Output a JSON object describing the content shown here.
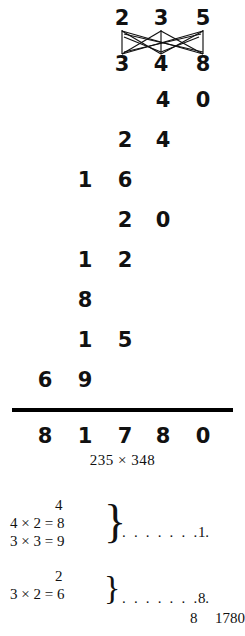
{
  "figure": {
    "caption": "235 × 348",
    "multiplicand": "235",
    "multiplier": "348",
    "product": "81780"
  },
  "lattice": {
    "top_row": [
      "2",
      "3",
      "5"
    ],
    "bottom_row": [
      "3",
      "4",
      "8"
    ],
    "top_label": "235",
    "bottom_label": "348",
    "line_color": "#111111"
  },
  "partial_rows": [
    {
      "c1": "",
      "c2": "",
      "c3": "",
      "c4": "4",
      "c5": "0"
    },
    {
      "c1": "",
      "c2": "",
      "c3": "2",
      "c4": "4",
      "c5": ""
    },
    {
      "c1": "",
      "c2": "1",
      "c3": "6",
      "c4": "",
      "c5": ""
    },
    {
      "c1": "",
      "c2": "",
      "c3": "2",
      "c4": "0",
      "c5": ""
    },
    {
      "c1": "",
      "c2": "1",
      "c3": "2",
      "c4": "",
      "c5": ""
    },
    {
      "c1": "",
      "c2": "8",
      "c3": "",
      "c4": "",
      "c5": ""
    },
    {
      "c1": "",
      "c2": "1",
      "c3": "5",
      "c4": "",
      "c5": ""
    },
    {
      "c1": "6",
      "c2": "9",
      "c3": "",
      "c4": "",
      "c5": ""
    }
  ],
  "result_row": {
    "c1": "8",
    "c2": "1",
    "c3": "7",
    "c4": "8",
    "c5": "0"
  },
  "explanation": {
    "groups": [
      {
        "carry": "4",
        "equations": [
          "4 × 2 = 8",
          "3 × 3 = 9"
        ],
        "brace": "}",
        "dots": ". . . . . . . .",
        "tail": "1"
      },
      {
        "carry": "2",
        "equations": [
          "3 × 2 = 6"
        ],
        "brace": "}",
        "dots": ". . . . . . . .",
        "tail": "8"
      }
    ],
    "final_carry": "8",
    "final_total": "1780"
  }
}
